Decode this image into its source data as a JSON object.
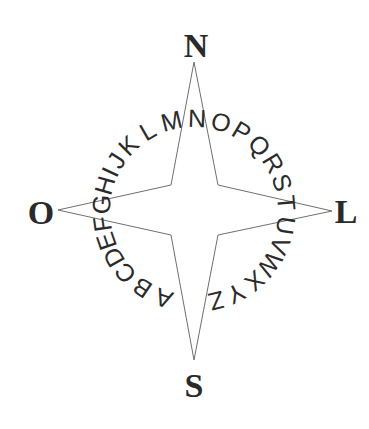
{
  "diagram": {
    "type": "compass-rose",
    "center": [
      194,
      211
    ],
    "star": {
      "tips": {
        "north": [
          194,
          62
        ],
        "east": [
          332,
          211
        ],
        "south": [
          194,
          360
        ],
        "west": [
          58,
          210
        ]
      },
      "inner_corners": {
        "north_east": [
          218,
          185
        ],
        "south_east": [
          218,
          235
        ],
        "south_west": [
          171,
          235
        ],
        "north_west": [
          171,
          185
        ]
      },
      "stroke_color": "#6f6f6f"
    },
    "cardinals": {
      "north": {
        "label": "N",
        "x": 196,
        "y": 57
      },
      "east": {
        "label": "L",
        "x": 346,
        "y": 223
      },
      "south": {
        "label": "S",
        "x": 194,
        "y": 397
      },
      "west": {
        "label": "O",
        "x": 41,
        "y": 224
      }
    },
    "ring": {
      "radius": 93,
      "text": "ABCDEFGHIJKLMNOPQRSTUVWXYZ",
      "letters": [
        {
          "char": "A",
          "angle": 199
        },
        {
          "char": "B",
          "angle": 214
        },
        {
          "char": "C",
          "angle": 228
        },
        {
          "char": "D",
          "angle": 240
        },
        {
          "char": "E",
          "angle": 251
        },
        {
          "char": "F",
          "angle": 262
        },
        {
          "char": "G",
          "angle": 274
        },
        {
          "char": "H",
          "angle": 286
        },
        {
          "char": "I",
          "angle": 295
        },
        {
          "char": "J",
          "angle": 303
        },
        {
          "char": "K",
          "angle": 315
        },
        {
          "char": "L",
          "angle": 330
        },
        {
          "char": "M",
          "angle": 346
        },
        {
          "char": "N",
          "angle": 2
        },
        {
          "char": "O",
          "angle": 17
        },
        {
          "char": "P",
          "angle": 31
        },
        {
          "char": "Q",
          "angle": 45
        },
        {
          "char": "R",
          "angle": 59
        },
        {
          "char": "S",
          "angle": 72
        },
        {
          "char": "T",
          "angle": 85
        },
        {
          "char": "U",
          "angle": 99
        },
        {
          "char": "V",
          "angle": 112
        },
        {
          "char": "W",
          "angle": 125
        },
        {
          "char": "X",
          "angle": 139
        },
        {
          "char": "Y",
          "angle": 153
        },
        {
          "char": "Z",
          "angle": 166
        }
      ]
    }
  }
}
